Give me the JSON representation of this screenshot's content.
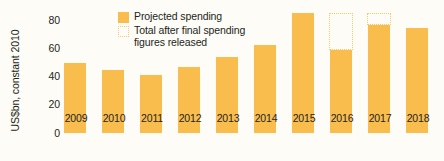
{
  "chart_data": {
    "type": "bar",
    "title": "",
    "xlabel": "",
    "ylabel": "US$bn, constant 2010",
    "ylim": [
      0,
      80
    ],
    "yticks": [
      0,
      20,
      40,
      60,
      80
    ],
    "grid": false,
    "categories": [
      "2009",
      "2010",
      "2011",
      "2012",
      "2013",
      "2014",
      "2015",
      "2016",
      "2017",
      "2018"
    ],
    "series": [
      {
        "name": "Projected spending",
        "style": "solid",
        "color": "#f9bd4e",
        "values": [
          49,
          44,
          41,
          46,
          53,
          62,
          84,
          58,
          76,
          74
        ]
      },
      {
        "name": "Total after final spending figures released",
        "style": "dotted-outline",
        "color": "#f6c96b",
        "values": [
          null,
          null,
          null,
          null,
          null,
          null,
          null,
          84,
          84,
          null
        ]
      }
    ],
    "legend": {
      "position": "top-center",
      "entries": [
        {
          "label": "Projected spending",
          "style": "solid",
          "color": "#f9bd4e"
        },
        {
          "label": "Total after final spending\nfigures released",
          "style": "dotted-outline",
          "color": "#f6c96b"
        }
      ]
    },
    "colors": {
      "background": "#fdfcf7",
      "bar": "#f9bd4e",
      "bar_outline": "#f6c96b",
      "text": "#231f20"
    }
  },
  "axes": {
    "y_title": "US$bn, constant 2010",
    "y_ticks": [
      "80",
      "60",
      "40",
      "20",
      "0"
    ],
    "x_ticks": [
      "2009",
      "2010",
      "2011",
      "2012",
      "2013",
      "2014",
      "2015",
      "2016",
      "2017",
      "2018"
    ]
  },
  "legend": {
    "entry_0_label": "Projected spending",
    "entry_1_label": "Total after final spending\nfigures released"
  }
}
